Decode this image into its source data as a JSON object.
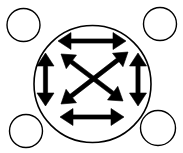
{
  "figure": {
    "canvas": {
      "width": 183,
      "height": 153,
      "background": "#ffffff"
    },
    "stroke_color": "#000000",
    "fill_color": "#000000",
    "main_circle": {
      "label": "main-circle",
      "cx": 92.5,
      "cy": 84.0,
      "r": 58.5,
      "stroke_width": 1.6,
      "fill": "none"
    },
    "corner_circles": [
      {
        "label": "corner-circle-top-left",
        "cx": 23.5,
        "cy": 25.0,
        "r": 16.5,
        "stroke_width": 1.4
      },
      {
        "label": "corner-circle-top-right",
        "cx": 160.0,
        "cy": 24.0,
        "r": 16.5,
        "stroke_width": 1.4
      },
      {
        "label": "corner-circle-bottom-left",
        "cx": 26.0,
        "cy": 131.0,
        "r": 16.5,
        "stroke_width": 1.4
      },
      {
        "label": "corner-circle-bottom-right",
        "cx": 158.0,
        "cy": 128.0,
        "r": 17.5,
        "stroke_width": 1.4
      }
    ],
    "arrows": [
      {
        "label": "arrow-top-horizontal",
        "orientation": "horizontal",
        "x1": 58.0,
        "y1": 41.0,
        "x2": 126.0,
        "y2": 41.0
      },
      {
        "label": "arrow-bottom-horizontal",
        "orientation": "horizontal",
        "x1": 60.0,
        "y1": 117.0,
        "x2": 124.0,
        "y2": 117.0
      },
      {
        "label": "arrow-left-vertical",
        "orientation": "vertical",
        "x1": 45.5,
        "y1": 53.0,
        "x2": 45.5,
        "y2": 106.0
      },
      {
        "label": "arrow-right-vertical",
        "orientation": "vertical",
        "x1": 138.0,
        "y1": 53.0,
        "x2": 138.0,
        "y2": 106.0
      },
      {
        "label": "arrow-diagonal-nw-se",
        "orientation": "diagonal",
        "x1": 61.0,
        "y1": 54.0,
        "x2": 123.0,
        "y2": 101.0
      },
      {
        "label": "arrow-diagonal-ne-sw",
        "orientation": "diagonal",
        "x1": 128.0,
        "y1": 52.0,
        "x2": 61.0,
        "y2": 104.0
      }
    ],
    "arrow_style": {
      "shaft_width": 4.2,
      "head_length": 13.0,
      "head_half_width": 8.5,
      "double_headed": true,
      "count": 6
    }
  }
}
